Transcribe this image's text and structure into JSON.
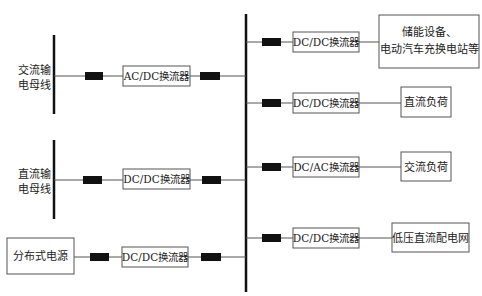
{
  "diagram": {
    "left_buses": {
      "ac_bus": {
        "label_line1": "交流输",
        "label_line2": "电母线"
      },
      "dc_bus": {
        "label_line1": "直流输",
        "label_line2": "电母线"
      }
    },
    "source": {
      "label": "分布式电源"
    },
    "input_converters": {
      "ac_dc": "AC/DC换流器",
      "dc_dc_bus": "DC/DC换流器",
      "dc_dc_source": "DC/DC换流器"
    },
    "output_branches": [
      {
        "converter": "DC/DC换流器",
        "load_line1": "储能设备、",
        "load_line2": "电动汽车充换电站等"
      },
      {
        "converter": "DC/DC换流器",
        "load": "直流负荷"
      },
      {
        "converter": "DC/AC换流器",
        "load": "交流负荷"
      },
      {
        "converter": "DC/DC换流器",
        "load": "低压直流配电网"
      }
    ],
    "colors": {
      "bus": "#111111",
      "wire": "#555555",
      "breaker": "#111111"
    }
  }
}
